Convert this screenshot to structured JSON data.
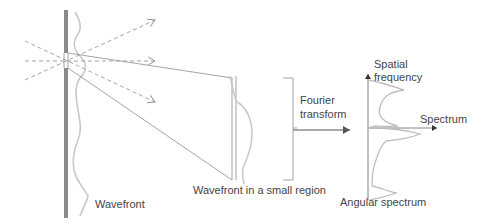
{
  "labels": {
    "wavefront": "Wavefront",
    "small_region": "Wavefront in a small region",
    "fourier_line1": "Fourier",
    "fourier_line2": "transform",
    "spatial_line1": "Spatial",
    "spatial_line2": "frequency",
    "spectrum_axis": "Spectrum",
    "angular_spectrum": "Angular spectrum"
  },
  "colors": {
    "wavefront_bar": "#8a8a8a",
    "curve": "#c8c8c8",
    "lines": "#9a9a9a",
    "dashed": "#9a9a9a",
    "text": "#444444",
    "axis": "#555555"
  },
  "icons": {
    "dashed-ray-arrows": "open arrowheads at end of dashed rays",
    "fourier-arrow": "solid arrow pointing right",
    "axis-arrows": "filled arrowheads on spectrum axes"
  }
}
